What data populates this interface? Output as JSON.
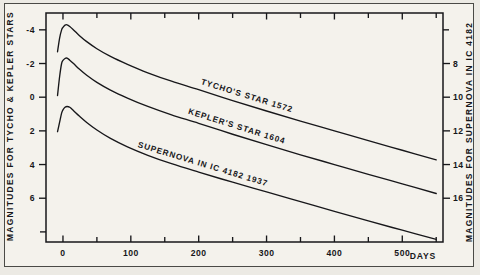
{
  "chart_data": {
    "type": "line",
    "title": "",
    "xlabel": "DAYS",
    "ylabel": "MAGNITUDES FOR TYCHO & KEPLER STARS",
    "ylabel_right": "MAGNITUDES FOR SUPERNOVA IN IC 4182",
    "xlim": [
      -25,
      560
    ],
    "ylim": [
      -5,
      8.6
    ],
    "y_inverted": true,
    "grid": false,
    "legend": "inline-labels",
    "x_ticks": [
      0,
      50,
      100,
      150,
      200,
      250,
      300,
      350,
      400,
      450,
      500,
      550
    ],
    "x_tick_labels": [
      "0",
      "",
      "100",
      "",
      "200",
      "",
      "300",
      "",
      "400",
      "",
      "500",
      ""
    ],
    "y_ticks_left": [
      -4,
      -2,
      0,
      2,
      4,
      6,
      8
    ],
    "y_tick_labels_left": [
      "-4",
      "-2",
      "0",
      "2",
      "4",
      "6",
      ""
    ],
    "y_ticks_right": [
      4,
      6,
      8,
      10,
      12,
      14,
      16
    ],
    "y_tick_labels_right": [
      "",
      "",
      "8",
      "10",
      "12",
      "14",
      "16"
    ],
    "right_axis_offset": 10,
    "series": [
      {
        "name": "TYCHO'S STAR",
        "year": "1572",
        "label": "TYCHO'S STAR   1572",
        "peak_magnitude": -4.3,
        "peak_day": 6,
        "x": [
          -8,
          -5,
          -2,
          0,
          3,
          6,
          10,
          16,
          24,
          35,
          50,
          70,
          95,
          125,
          160,
          200,
          250,
          300,
          350,
          400,
          450,
          500,
          550
        ],
        "y": [
          -2.7,
          -3.5,
          -4.0,
          -4.15,
          -4.28,
          -4.3,
          -4.2,
          -3.98,
          -3.67,
          -3.3,
          -2.88,
          -2.42,
          -1.95,
          -1.45,
          -0.95,
          -0.45,
          0.2,
          0.82,
          1.42,
          2.0,
          2.58,
          3.15,
          3.72
        ]
      },
      {
        "name": "KEPLER'S STAR",
        "year": "1604",
        "label": "KEPLER'S STAR   1604",
        "peak_magnitude": -2.3,
        "peak_day": 6,
        "x": [
          -8,
          -5,
          -2,
          0,
          3,
          6,
          10,
          16,
          24,
          35,
          50,
          70,
          95,
          125,
          160,
          200,
          250,
          300,
          350,
          400,
          450,
          500,
          550
        ],
        "y": [
          -0.1,
          -1.2,
          -2.0,
          -2.18,
          -2.3,
          -2.32,
          -2.2,
          -1.98,
          -1.67,
          -1.3,
          -0.88,
          -0.42,
          0.05,
          0.55,
          1.05,
          1.55,
          2.2,
          2.82,
          3.42,
          4.0,
          4.58,
          5.15,
          5.72
        ]
      },
      {
        "name": "SUPERNOVA IN IC 4182",
        "year": "1937",
        "label": "SUPERNOVA  IN   IC 4182    1937",
        "peak_magnitude": 0.55,
        "peak_day": 8,
        "x": [
          -8,
          -5,
          -2,
          0,
          3,
          6,
          10,
          16,
          24,
          35,
          50,
          70,
          95,
          125,
          160,
          200,
          250,
          300,
          350,
          400,
          450,
          500,
          550
        ],
        "y": [
          2.05,
          1.5,
          0.95,
          0.75,
          0.6,
          0.55,
          0.6,
          0.82,
          1.12,
          1.5,
          1.95,
          2.45,
          2.95,
          3.45,
          3.95,
          4.45,
          5.05,
          5.62,
          6.2,
          6.78,
          7.35,
          7.9,
          8.45
        ]
      }
    ]
  },
  "axes": {
    "left_title": "MAGNITUDES FOR TYCHO & KEPLER STARS",
    "right_title": "MAGNITUDES FOR SUPERNOVA IN IC 4182",
    "x_unit_label": "DAYS"
  },
  "colors": {
    "ink": "#17171a",
    "paper": "#f4f2ec",
    "surround": "#eceae4"
  }
}
